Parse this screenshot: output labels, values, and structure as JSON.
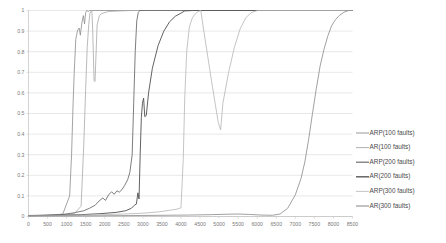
{
  "chart_data": {
    "type": "line",
    "title": "",
    "xlabel": "",
    "ylabel": "",
    "xlim": [
      0,
      8500
    ],
    "ylim": [
      0,
      1
    ],
    "grid": "horizontal",
    "legend_position": "right",
    "x_ticks": [
      "0",
      "500",
      "1000",
      "1500",
      "2000",
      "2500",
      "3000",
      "3500",
      "4000",
      "4500",
      "5000",
      "5500",
      "6000",
      "6500",
      "7000",
      "7500",
      "8000",
      "8500"
    ],
    "y_ticks": [
      "0",
      "0.1",
      "0.2",
      "0.3",
      "0.4",
      "0.5",
      "0.6",
      "0.7",
      "0.8",
      "0.9",
      "1"
    ],
    "series": [
      {
        "name": "ARP(100 faults)",
        "color": "#8c8c8c",
        "width": 0.8,
        "points": [
          [
            0,
            0.005
          ],
          [
            400,
            0.006
          ],
          [
            700,
            0.008
          ],
          [
            900,
            0.012
          ],
          [
            1080,
            0.1
          ],
          [
            1130,
            0.3
          ],
          [
            1170,
            0.55
          ],
          [
            1200,
            0.7
          ],
          [
            1240,
            0.86
          ],
          [
            1290,
            0.905
          ],
          [
            1330,
            0.915
          ],
          [
            1360,
            0.88
          ],
          [
            1400,
            0.94
          ],
          [
            1440,
            0.975
          ],
          [
            1470,
            0.935
          ],
          [
            1500,
            0.99
          ],
          [
            1530,
            1.0
          ],
          [
            1570,
            0.995
          ],
          [
            1600,
            1.0
          ],
          [
            8500,
            1.0
          ]
        ]
      },
      {
        "name": "AR(100 faults)",
        "color": "#a8a8a8",
        "width": 0.8,
        "points": [
          [
            0,
            0.005
          ],
          [
            600,
            0.007
          ],
          [
            1000,
            0.01
          ],
          [
            1200,
            0.014
          ],
          [
            1380,
            0.05
          ],
          [
            1450,
            0.35
          ],
          [
            1500,
            0.62
          ],
          [
            1540,
            0.82
          ],
          [
            1580,
            0.93
          ],
          [
            1610,
            0.985
          ],
          [
            1640,
            0.995
          ],
          [
            1660,
            1.0
          ],
          [
            1680,
            0.93
          ],
          [
            1700,
            0.8
          ],
          [
            1720,
            0.66
          ],
          [
            1745,
            0.655
          ],
          [
            1800,
            0.93
          ],
          [
            1860,
            0.975
          ],
          [
            1920,
            0.985
          ],
          [
            2100,
            0.995
          ],
          [
            2400,
            0.998
          ],
          [
            2700,
            1.0
          ],
          [
            8500,
            1.0
          ]
        ]
      },
      {
        "name": "ARP(200 faults)",
        "color": "#6e6e6e",
        "width": 0.9,
        "points": [
          [
            0,
            0.004
          ],
          [
            500,
            0.006
          ],
          [
            900,
            0.01
          ],
          [
            1200,
            0.018
          ],
          [
            1450,
            0.028
          ],
          [
            1600,
            0.04
          ],
          [
            1750,
            0.055
          ],
          [
            1850,
            0.075
          ],
          [
            1950,
            0.09
          ],
          [
            2020,
            0.078
          ],
          [
            2100,
            0.105
          ],
          [
            2180,
            0.12
          ],
          [
            2250,
            0.108
          ],
          [
            2320,
            0.125
          ],
          [
            2380,
            0.118
          ],
          [
            2450,
            0.13
          ],
          [
            2520,
            0.15
          ],
          [
            2600,
            0.178
          ],
          [
            2660,
            0.215
          ],
          [
            2720,
            0.3
          ],
          [
            2760,
            0.55
          ],
          [
            2800,
            0.8
          ],
          [
            2840,
            0.95
          ],
          [
            2880,
            0.99
          ],
          [
            2920,
            1.0
          ],
          [
            8500,
            1.0
          ]
        ]
      },
      {
        "name": "AR(200 faults)",
        "color": "#5a5a5a",
        "width": 0.95,
        "points": [
          [
            0,
            0.004
          ],
          [
            800,
            0.006
          ],
          [
            1400,
            0.009
          ],
          [
            1900,
            0.014
          ],
          [
            2300,
            0.02
          ],
          [
            2550,
            0.028
          ],
          [
            2700,
            0.04
          ],
          [
            2780,
            0.055
          ],
          [
            2830,
            0.06
          ],
          [
            2870,
            0.115
          ],
          [
            2900,
            0.085
          ],
          [
            2930,
            0.3
          ],
          [
            2960,
            0.48
          ],
          [
            2990,
            0.55
          ],
          [
            3020,
            0.575
          ],
          [
            3050,
            0.485
          ],
          [
            3090,
            0.49
          ],
          [
            3150,
            0.6
          ],
          [
            3250,
            0.72
          ],
          [
            3400,
            0.83
          ],
          [
            3550,
            0.9
          ],
          [
            3700,
            0.945
          ],
          [
            3850,
            0.972
          ],
          [
            3980,
            0.985
          ],
          [
            4100,
            0.998
          ],
          [
            4300,
            1.0
          ],
          [
            8500,
            1.0
          ]
        ]
      },
      {
        "name": "ARP(300 faults)",
        "color": "#b5b5b5",
        "width": 0.8,
        "points": [
          [
            0,
            0.003
          ],
          [
            1000,
            0.005
          ],
          [
            1800,
            0.008
          ],
          [
            2500,
            0.012
          ],
          [
            3000,
            0.016
          ],
          [
            3400,
            0.022
          ],
          [
            3700,
            0.03
          ],
          [
            3900,
            0.036
          ],
          [
            4000,
            0.042
          ],
          [
            4060,
            0.28
          ],
          [
            4100,
            0.58
          ],
          [
            4150,
            0.8
          ],
          [
            4220,
            0.92
          ],
          [
            4300,
            0.965
          ],
          [
            4380,
            0.985
          ],
          [
            4450,
            0.995
          ],
          [
            4520,
            1.0
          ],
          [
            4600,
            0.9
          ],
          [
            4700,
            0.78
          ],
          [
            4800,
            0.66
          ],
          [
            4900,
            0.545
          ],
          [
            4980,
            0.455
          ],
          [
            5040,
            0.42
          ],
          [
            5100,
            0.55
          ],
          [
            5250,
            0.7
          ],
          [
            5400,
            0.82
          ],
          [
            5550,
            0.91
          ],
          [
            5700,
            0.965
          ],
          [
            5850,
            0.99
          ],
          [
            6000,
            1.0
          ],
          [
            8500,
            1.0
          ]
        ]
      },
      {
        "name": "AR(300 faults)",
        "color": "#909090",
        "width": 0.85,
        "points": [
          [
            0,
            0.002
          ],
          [
            1500,
            0.003
          ],
          [
            3000,
            0.005
          ],
          [
            4200,
            0.007
          ],
          [
            4800,
            0.009
          ],
          [
            5200,
            0.011
          ],
          [
            5500,
            0.012
          ],
          [
            5800,
            0.01
          ],
          [
            6100,
            0.007
          ],
          [
            6400,
            0.006
          ],
          [
            6600,
            0.012
          ],
          [
            6800,
            0.04
          ],
          [
            7000,
            0.105
          ],
          [
            7150,
            0.185
          ],
          [
            7250,
            0.265
          ],
          [
            7350,
            0.375
          ],
          [
            7450,
            0.5
          ],
          [
            7550,
            0.62
          ],
          [
            7650,
            0.73
          ],
          [
            7750,
            0.81
          ],
          [
            7850,
            0.875
          ],
          [
            7950,
            0.925
          ],
          [
            8050,
            0.955
          ],
          [
            8150,
            0.975
          ],
          [
            8280,
            0.992
          ],
          [
            8400,
            1.0
          ],
          [
            8500,
            1.0
          ]
        ]
      }
    ]
  },
  "legend": {
    "items": [
      {
        "label": "ARP(100 faults)",
        "color": "#8c8c8c",
        "width": 0.9
      },
      {
        "label": "AR(100 faults)",
        "color": "#a8a8a8",
        "width": 0.9
      },
      {
        "label": "ARP(200 faults)",
        "color": "#6e6e6e",
        "width": 1.2
      },
      {
        "label": "AR(200 faults)",
        "color": "#5a5a5a",
        "width": 1.4
      },
      {
        "label": "ARP(300 faults)",
        "color": "#b5b5b5",
        "width": 0.8
      },
      {
        "label": "AR(300 faults)",
        "color": "#909090",
        "width": 1.1
      }
    ]
  }
}
